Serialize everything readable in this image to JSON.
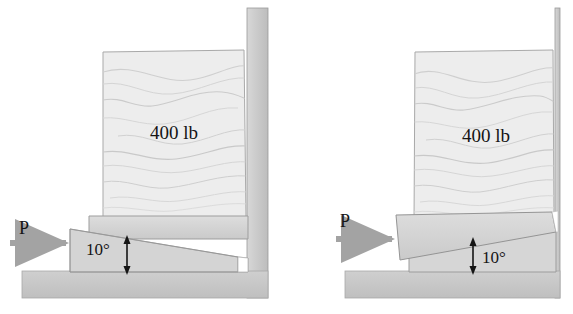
{
  "figure": {
    "panel_count": 2,
    "colors": {
      "wood_fill": "#ececec",
      "wood_grain": "#c9c9c9",
      "wedge_fill": "#d2d2d2",
      "wedge_fill_light": "#dcdcdc",
      "ground_fill": "#c6c6c6",
      "wall_fill": "#cfcfcf",
      "outline": "#8f8f8f",
      "arrow_gray": "#a3a3a3",
      "text_black": "#151515",
      "background": "#ffffff"
    },
    "panels": [
      {
        "id": "left-panel",
        "name": "initial-position",
        "weight_label": "400 lb",
        "force_label": "P",
        "angle_label": "10°",
        "angle_value": 10,
        "angle_unit": "degrees",
        "weight_value": 400,
        "weight_unit": "lb",
        "angle_label_side": "left-of-arrow",
        "has_wall": true,
        "has_ground": true
      },
      {
        "id": "right-panel",
        "name": "wedge-driven-position",
        "weight_label": "400 lb",
        "force_label": "P",
        "angle_label": "10°",
        "angle_value": 10,
        "angle_unit": "degrees",
        "weight_value": 400,
        "weight_unit": "lb",
        "angle_label_side": "right-of-arrow",
        "has_wall": true,
        "has_ground": true
      }
    ]
  }
}
